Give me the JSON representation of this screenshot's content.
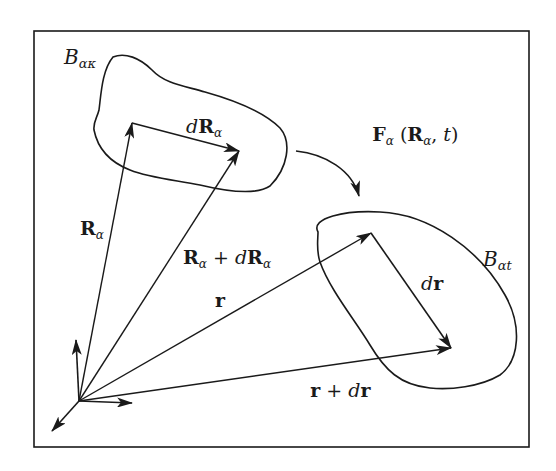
{
  "figure": {
    "frame": {
      "x": 34,
      "y": 31,
      "width": 495,
      "height": 416
    },
    "stroke_color": "#1a1a1a",
    "background": "#ffffff"
  },
  "labels": {
    "reference_body": {
      "base": "B",
      "sub": "ακ"
    },
    "current_body": {
      "base": "B",
      "sub": "αt"
    },
    "R_alpha": {
      "base": "R",
      "sub": "α"
    },
    "dR_alpha": {
      "pre": "d",
      "base": "R",
      "sub": "α"
    },
    "R_plus_dR": {
      "base1": "R",
      "sub1": "α",
      "op": " + ",
      "pre2": "d",
      "base2": "R",
      "sub2": "α"
    },
    "r": {
      "base": "r"
    },
    "dr": {
      "pre": "d",
      "base": "r"
    },
    "r_plus_dr": {
      "base1": "r",
      "op": " + ",
      "pre2": "d",
      "base2": "r"
    },
    "mapping": {
      "base": "F",
      "sub": "α",
      "open": " (",
      "arg1": "R",
      "arg1_sub": "α",
      "sep": ", ",
      "arg2": "t",
      "close": ")"
    }
  },
  "geometry": {
    "origin": [
      79,
      401
    ],
    "axes": {
      "x_tip": [
        132,
        403
      ],
      "y_tip": [
        76,
        340
      ],
      "z_tip": [
        52,
        431
      ]
    },
    "vectors": {
      "R_alpha_tip": [
        132,
        123
      ],
      "R_plus_dR_tip": [
        239,
        151
      ],
      "r_tip": [
        371,
        233
      ],
      "r_plus_dr_tip": [
        451,
        348
      ]
    }
  }
}
